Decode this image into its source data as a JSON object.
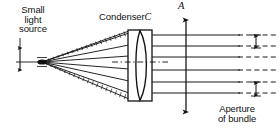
{
  "figure": {
    "title_label_source": "Small\nlight\nsource",
    "label_condenser_text": "Condenser",
    "label_condenser_symbol": "C",
    "label_axis_arrow": "A",
    "label_aperture": "Aperture\nof bundle",
    "colors": {
      "ink": "#111111",
      "background": "#ffffff",
      "ray_line": "#1a1a1a",
      "hatch": "#333333"
    }
  },
  "optics": {
    "source_point": {
      "x": 42,
      "y": 62
    },
    "source_tick": {
      "x": 20,
      "y_top": 48,
      "y_bottom": 70
    },
    "condenser": {
      "frame_x_left": 128,
      "frame_x_right": 152,
      "frame_y_top": 30,
      "frame_y_bottom": 101,
      "lens_x_left": 131,
      "lens_x_right": 149,
      "type": "biconvex"
    },
    "optical_axis_y": 62,
    "rays": [
      {
        "id": "ray-1",
        "y_at_lens": 35,
        "y_exit": 35
      },
      {
        "id": "ray-2",
        "y_at_lens": 46,
        "y_exit": 46
      },
      {
        "id": "ray-3",
        "y_at_lens": 57,
        "y_exit": 57
      },
      {
        "id": "ray-4",
        "y_at_lens": 70,
        "y_exit": 70
      },
      {
        "id": "ray-5",
        "y_at_lens": 82,
        "y_exit": 82
      },
      {
        "id": "ray-6",
        "y_at_lens": 93,
        "y_exit": 93
      }
    ],
    "aperture_arrow": {
      "x": 186,
      "y_top": 20,
      "y_bottom": 112
    },
    "spacing_arrows": [
      {
        "id": "spacing-arrow-top",
        "x": 256,
        "y_top": 36,
        "y_bottom": 48
      },
      {
        "id": "spacing-arrow-bottom",
        "x": 256,
        "y_top": 82,
        "y_bottom": 96
      }
    ]
  }
}
